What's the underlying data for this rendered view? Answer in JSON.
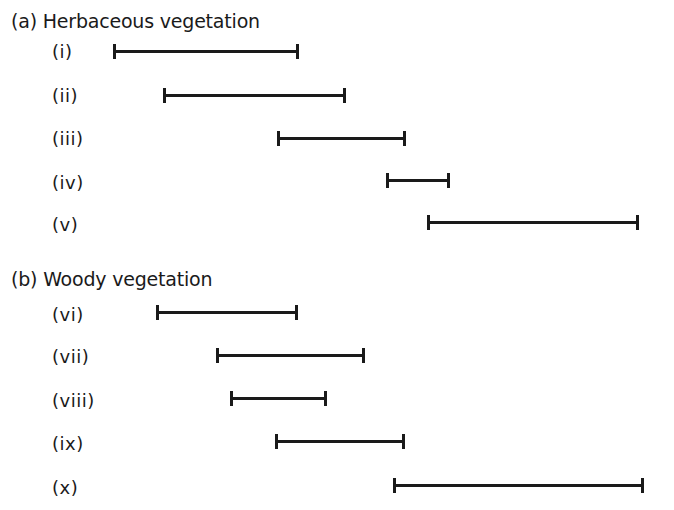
{
  "sections": [
    {
      "header": "(a) Herbaceous vegetation",
      "items": [
        {
          "label": "(i)",
          "start_x": 114,
          "end_x": 298,
          "y": 51
        },
        {
          "label": "(ii)",
          "start_x": 164,
          "end_x": 345,
          "y": 95
        },
        {
          "label": "(iii)",
          "start_x": 278,
          "end_x": 405,
          "y": 138
        },
        {
          "label": "(iv)",
          "start_x": 387,
          "end_x": 449,
          "y": 180
        },
        {
          "label": "(v)",
          "start_x": 428,
          "end_x": 638,
          "y": 222
        }
      ]
    },
    {
      "header": "(b) Woody vegetation",
      "items": [
        {
          "label": "(vi)",
          "start_x": 157,
          "end_x": 297,
          "y": 312
        },
        {
          "label": "(vii)",
          "start_x": 217,
          "end_x": 364,
          "y": 355
        },
        {
          "label": "(viii)",
          "start_x": 231,
          "end_x": 326,
          "y": 398
        },
        {
          "label": "(ix)",
          "start_x": 276,
          "end_x": 404,
          "y": 441
        },
        {
          "label": "(x)",
          "start_x": 394,
          "end_x": 643,
          "y": 485
        }
      ]
    }
  ],
  "colors": {
    "ink": "#1a1a1a",
    "background": "#ffffff"
  }
}
